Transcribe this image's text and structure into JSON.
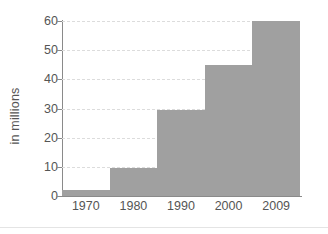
{
  "chart_data": {
    "type": "bar",
    "title": "",
    "subtitle": "",
    "xlabel": "",
    "ylabel": "in millions",
    "categories": [
      "1970",
      "1980",
      "1990",
      "2000",
      "2009"
    ],
    "values": [
      2,
      9.5,
      29.5,
      45,
      60
    ],
    "series": [
      {
        "name": "in millions",
        "values": [
          2,
          9.5,
          29.5,
          45,
          60
        ]
      }
    ],
    "ylim": [
      0,
      60
    ],
    "yticks": [
      0,
      10,
      20,
      30,
      40,
      50,
      60
    ],
    "ytick_labels": [
      "0",
      "10",
      "20",
      "30",
      "40",
      "50",
      "60"
    ],
    "grid": true,
    "grid_style": "dashed-horizontal",
    "legend": "none",
    "bar_gap": "none",
    "colors": {
      "bar": "#a0a0a0",
      "axis": "#8a8a8a",
      "grid": "#dcdcdc",
      "text": "#555555",
      "background": "#ffffff"
    }
  }
}
